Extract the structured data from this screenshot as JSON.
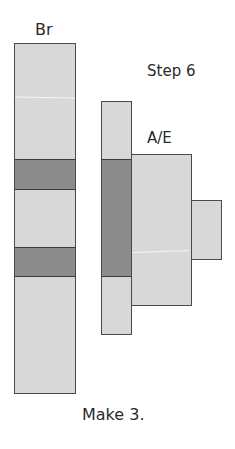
{
  "labels": {
    "br": "Br",
    "step": "Step 6",
    "ae": "A/E",
    "instruction": "Make 3."
  },
  "colors": {
    "light_fill": "#d8d8d8",
    "dark_fill": "#8c8c8c",
    "border": "#4a4a4a"
  },
  "pieces": {
    "br_strip": {
      "x": 14,
      "y": 43,
      "w": 62,
      "h": 351,
      "dark_bands": [
        [
          159,
          189
        ],
        [
          247,
          276
        ]
      ]
    },
    "middle_strip": {
      "x": 101,
      "y": 101,
      "w": 31,
      "h": 234,
      "dark_band": [
        159,
        276
      ]
    },
    "ae_block": {
      "x": 131,
      "y": 154,
      "w": 61,
      "h": 152
    },
    "tab": {
      "x": 191,
      "y": 200,
      "w": 31,
      "h": 60
    }
  }
}
